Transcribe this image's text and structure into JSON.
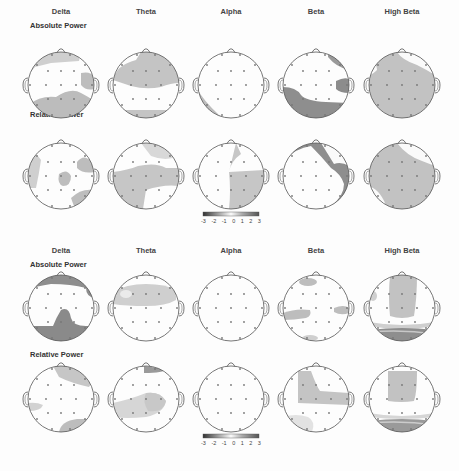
{
  "figure": {
    "groups": [
      {
        "id": "group1",
        "bands": [
          "Delta",
          "Theta",
          "Alpha",
          "Beta",
          "High Beta"
        ],
        "rows": [
          {
            "label": "Absolute Power",
            "maps": [
              {
                "band": "Delta",
                "regions": [
                  "frontal-left-mid light",
                  "right-temporal light",
                  "occipital-parietal light"
                ]
              },
              {
                "band": "Theta",
                "regions": [
                  "frontal-central broad light",
                  "occipital rim light"
                ]
              },
              {
                "band": "Alpha",
                "regions": [
                  "left-posterior rim light"
                ]
              },
              {
                "band": "Beta",
                "regions": [
                  "right-frontal rim dark",
                  "right-temporal dark",
                  "left-temporal-occipital dark"
                ]
              },
              {
                "band": "High Beta",
                "regions": [
                  "whole-head light except right-frontal"
                ]
              }
            ]
          },
          {
            "label": "Relative Power",
            "maps": [
              {
                "band": "Delta",
                "regions": [
                  "left-temporal light",
                  "right-frontal light",
                  "central light",
                  "right-posterior light"
                ]
              },
              {
                "band": "Theta",
                "regions": [
                  "frontal-right light",
                  "central broad light",
                  "left-posterior light"
                ]
              },
              {
                "band": "Alpha",
                "regions": [
                  "right hemisphere light"
                ]
              },
              {
                "band": "Beta",
                "regions": [
                  "frontal-left to right-posterior dark band"
                ]
              },
              {
                "band": "High Beta",
                "regions": [
                  "broad central light"
                ]
              }
            ]
          }
        ],
        "colorbar": {
          "ticks": [
            "-3",
            "-2",
            "-1",
            "0",
            "1",
            "2",
            "3"
          ]
        }
      },
      {
        "id": "group2",
        "bands": [
          "Delta",
          "Theta",
          "Alpha",
          "Beta",
          "High Beta"
        ],
        "rows": [
          {
            "label": "Absolute Power",
            "maps": [
              {
                "band": "Delta",
                "regions": [
                  "frontal-right dark",
                  "occipital dark"
                ]
              },
              {
                "band": "Theta",
                "regions": [
                  "frontal band light"
                ]
              },
              {
                "band": "Alpha",
                "regions": []
              },
              {
                "band": "Beta",
                "regions": [
                  "frontal small light",
                  "left-temporal light",
                  "right-temporal light",
                  "occipital small light"
                ]
              },
              {
                "band": "High Beta",
                "regions": [
                  "frontal-central light",
                  "occipital dark band"
                ]
              }
            ]
          },
          {
            "label": "Relative Power",
            "maps": [
              {
                "band": "Delta",
                "regions": [
                  "frontal-right light",
                  "left-temporal light",
                  "occipital light"
                ]
              },
              {
                "band": "Theta",
                "regions": [
                  "frontal-right dark small",
                  "central light"
                ]
              },
              {
                "band": "Alpha",
                "regions": []
              },
              {
                "band": "Beta",
                "regions": [
                  "left-frontal-central light",
                  "occipital faint"
                ]
              },
              {
                "band": "High Beta",
                "regions": [
                  "frontal-central light",
                  "occipital band"
                ]
              }
            ]
          }
        ],
        "colorbar": {
          "ticks": [
            "-3",
            "-2",
            "-1",
            "0",
            "1",
            "2",
            "3"
          ]
        }
      }
    ],
    "colors": {
      "light": "#c4c4c4",
      "mid": "#a9a9a9",
      "dark": "#8a8a8a",
      "outline": "#555555",
      "electrode": "#777777"
    }
  }
}
